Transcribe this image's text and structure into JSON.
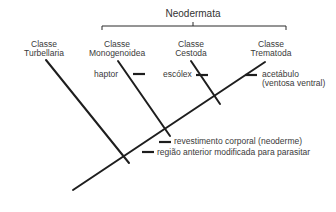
{
  "clade": {
    "label": "Neodermata"
  },
  "taxa": [
    {
      "id": "turbellaria",
      "line1": "Classe",
      "line2": "Turbellaria"
    },
    {
      "id": "monogenoidea",
      "line1": "Classe",
      "line2": "Monogenoidea"
    },
    {
      "id": "cestoda",
      "line1": "Classe",
      "line2": "Cestoda"
    },
    {
      "id": "trematoda",
      "line1": "Classe",
      "line2": "Trematoda"
    }
  ],
  "characters": {
    "haptor": "haptor",
    "escolex": "escólex",
    "acetabulo_line1": "acetábulo",
    "acetabulo_line2": "(ventosa ventral)",
    "revestimento": "revestimento corporal (neoderme)",
    "regiao": "região anterior modificada para parasitar"
  },
  "colors": {
    "line": "#1e1e1e",
    "text": "#3a3a3a"
  }
}
